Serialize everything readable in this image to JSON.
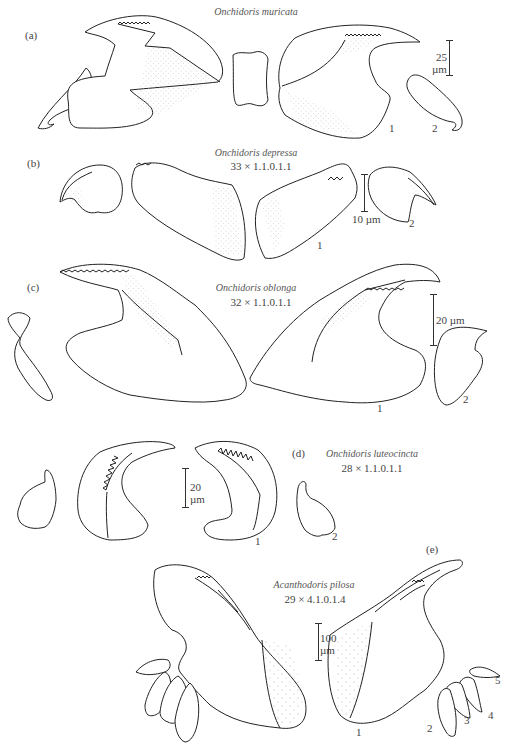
{
  "figure": {
    "panels": [
      {
        "id": "a",
        "panel_label": "(a)",
        "species": "Onchidoris muricata",
        "formula": "",
        "scale_value": "25",
        "scale_unit": "µm",
        "tooth_labels": [
          "1",
          "2"
        ]
      },
      {
        "id": "b",
        "panel_label": "(b)",
        "species": "Onchidoris depressa",
        "formula": "33 × 1.1.0.1.1",
        "scale_value": "10",
        "scale_unit": "µm",
        "tooth_labels": [
          "1",
          "2"
        ]
      },
      {
        "id": "c",
        "panel_label": "(c)",
        "species": "Onchidoris oblonga",
        "formula": "32 × 1.1.0.1.1",
        "scale_value": "20",
        "scale_unit": "µm",
        "tooth_labels": [
          "1",
          "2"
        ]
      },
      {
        "id": "d",
        "panel_label": "(d)",
        "species": "Onchidoris luteocincta",
        "formula": "28 × 1.1.0.1.1",
        "scale_value": "20",
        "scale_unit": "µm",
        "tooth_labels": [
          "1",
          "2"
        ]
      },
      {
        "id": "e",
        "panel_label": "(e)",
        "species": "Acanthodoris pilosa",
        "formula": "29 × 4.1.0.1.4",
        "scale_value": "100",
        "scale_unit": "µm",
        "tooth_labels": [
          "1",
          "2",
          "3",
          "4",
          "5"
        ]
      }
    ]
  }
}
